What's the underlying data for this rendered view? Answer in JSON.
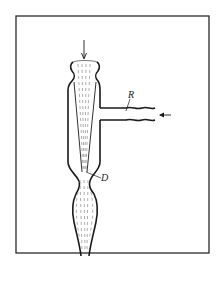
{
  "figure": {
    "labels": {
      "R": "R",
      "D": "D"
    },
    "colors": {
      "ink": "#1a1a1a",
      "frame": "#2a2a2a",
      "dashes": "#8a8a8a",
      "background": "#ffffff"
    }
  }
}
